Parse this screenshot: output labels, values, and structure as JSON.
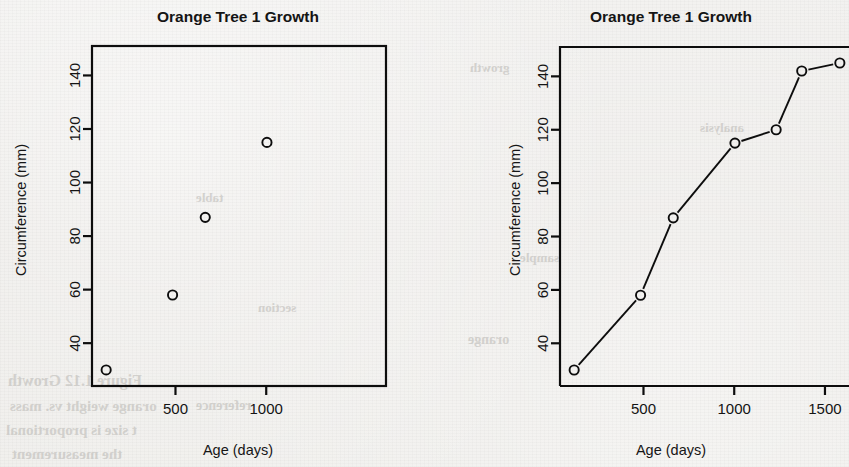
{
  "page": {
    "background_color": "#efeeec",
    "ink_color": "#0d0d0d",
    "media": "scanned-book-page",
    "ghost_text": [
      {
        "text": "Figure 1.12  Growth",
        "x": 8,
        "y": 372,
        "size": 16
      },
      {
        "text": "orange weight vs. mass",
        "x": 10,
        "y": 398,
        "size": 15
      },
      {
        "text": "t size is proportional",
        "x": 6,
        "y": 422,
        "size": 15
      },
      {
        "text": "the measurement",
        "x": 12,
        "y": 446,
        "size": 15
      },
      {
        "text": "reference",
        "x": 196,
        "y": 398,
        "size": 14
      },
      {
        "text": "section",
        "x": 258,
        "y": 300,
        "size": 13
      },
      {
        "text": "table",
        "x": 196,
        "y": 190,
        "size": 13
      },
      {
        "text": "growth",
        "x": 470,
        "y": 60,
        "size": 13
      },
      {
        "text": "analysis",
        "x": 700,
        "y": 120,
        "size": 13
      },
      {
        "text": "sample",
        "x": 520,
        "y": 250,
        "size": 13
      },
      {
        "text": "orange",
        "x": 468,
        "y": 332,
        "size": 14
      }
    ]
  },
  "panels": [
    {
      "id": "scatter",
      "title": "Orange Tree 1 Growth",
      "xlabel": "Age (days)",
      "ylabel": "Circumference (mm)"
    },
    {
      "id": "line",
      "title": "Orange Tree 1 Growth",
      "xlabel": "Age (days)",
      "ylabel": "Circumference (mm)",
      "clipped_right_edge": true
    }
  ],
  "chart_data": [
    {
      "type": "scatter",
      "title": "Orange Tree 1 Growth",
      "xlabel": "Age (days)",
      "ylabel": "Circumference (mm)",
      "x": [
        118,
        484,
        664,
        1004,
        1231,
        1372,
        1582
      ],
      "values": [
        30,
        58,
        87,
        115,
        120,
        142,
        145
      ],
      "xticks": [
        500,
        1000,
        1500
      ],
      "yticks": [
        40,
        60,
        80,
        100,
        120,
        140
      ],
      "xlim": [
        40,
        1660
      ],
      "ylim": [
        24,
        151
      ],
      "grid": false,
      "legend": null,
      "marker": "open-circle",
      "marker_color": "#0d0d0d"
    },
    {
      "type": "line",
      "title": "Orange Tree 1 Growth",
      "xlabel": "Age (days)",
      "ylabel": "Circumference (mm)",
      "x": [
        118,
        484,
        664,
        1004,
        1231,
        1372,
        1582
      ],
      "values": [
        30,
        58,
        87,
        115,
        120,
        142,
        145
      ],
      "xticks": [
        500,
        1000,
        1500
      ],
      "yticks": [
        40,
        60,
        80,
        100,
        120,
        140
      ],
      "xlim": [
        40,
        1660
      ],
      "ylim": [
        24,
        151
      ],
      "grid": false,
      "legend": null,
      "marker": "open-circle",
      "marker_color": "#0d0d0d",
      "line_color": "#0d0d0d",
      "line_style": "points-and-lines"
    }
  ]
}
